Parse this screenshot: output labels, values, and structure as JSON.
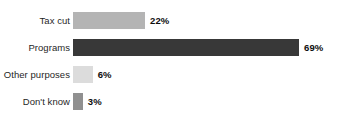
{
  "chart_data": {
    "type": "bar",
    "orientation": "horizontal",
    "title": "",
    "subtitle": "",
    "xlabel": "",
    "ylabel": "",
    "grid": false,
    "legend": "none",
    "axis_visible": false,
    "xlim": [
      0,
      80
    ],
    "categories": [
      "Tax cut",
      "Programs",
      "Other purposes",
      "Don't know"
    ],
    "values": [
      22,
      69,
      6,
      3
    ],
    "value_labels": [
      "22%",
      "69%",
      "6%",
      "3%"
    ],
    "bar_colors": [
      "#b4b4b4",
      "#383838",
      "#dcdcdc",
      "#909090"
    ],
    "units": "percent",
    "background_color": "#ffffff",
    "text_color": "#1f1f1f"
  }
}
